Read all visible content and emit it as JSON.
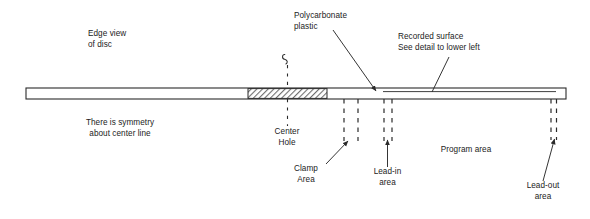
{
  "figure": {
    "type": "technical-diagram",
    "background_color": "#ffffff",
    "line_color": "#2a2a2a",
    "text_color": "#1b1b1b",
    "hatch_color": "#8a8a8a"
  },
  "labels": {
    "edge_view": "Edge view\nof disc",
    "symmetry": "There is symmetry\nabout center line",
    "polycarbonate": "Polycarbonate\nplastic",
    "recorded_surface": "Recorded surface\nSee detail to lower left",
    "center_hole": "Center\nHole",
    "clamp_area": "Clamp\nArea",
    "lead_in": "Lead-in\narea",
    "program_area": "Program area",
    "lead_out": "Lead-out\narea"
  },
  "geometry": {
    "disc_bar": {
      "x": 26,
      "y": 88,
      "width": 540,
      "height": 11
    },
    "hatched_section": {
      "x": 248,
      "y": 89,
      "width": 79,
      "height": 9
    },
    "recorded_surface_line": {
      "x1": 383,
      "y1": 92,
      "x2": 556,
      "y2": 92
    },
    "center_line_x": 287.5,
    "clamp_dash_x": [
      344,
      358
    ],
    "lead_in_dash_x": [
      384,
      392
    ],
    "lead_out_dash_x": [
      551,
      556
    ]
  },
  "annotations": {
    "polycarbonate_arrow": {
      "x1": 333,
      "y1": 30,
      "x2": 375,
      "y2": 90
    },
    "recorded_surface_arrow": {
      "x1": 448,
      "y1": 56,
      "x2": 432,
      "y2": 91
    },
    "clamp_arrow": {
      "x1": 326,
      "y1": 163,
      "x2": 347,
      "y2": 141
    },
    "lead_in_arrow": {
      "x1": 387,
      "y1": 166,
      "x2": 387,
      "y2": 141
    },
    "lead_out_arrow": {
      "x1": 543,
      "y1": 180,
      "x2": 554,
      "y2": 140
    }
  }
}
